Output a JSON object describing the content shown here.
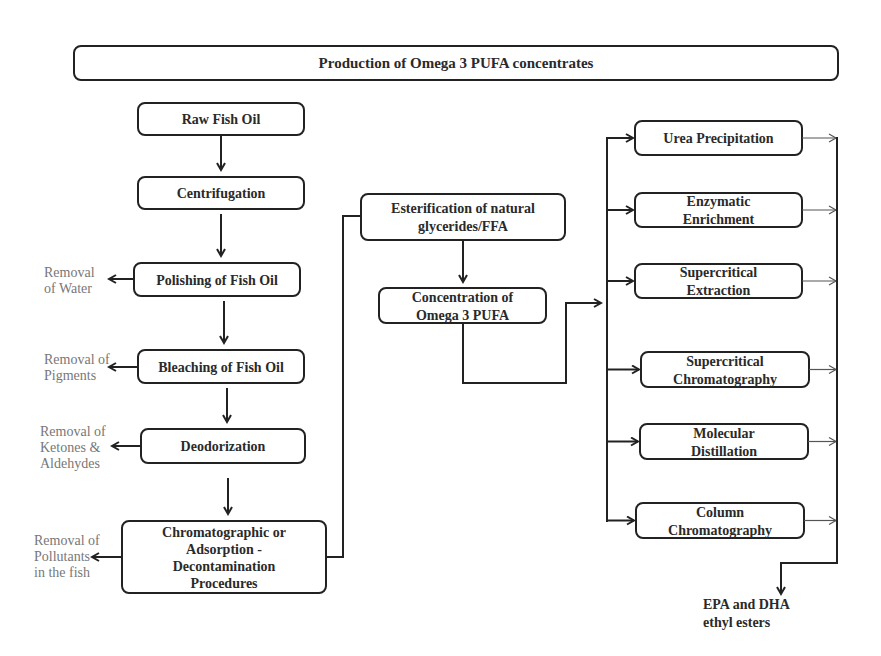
{
  "title": "Production of Omega 3 PUFA concentrates",
  "left_chain": [
    {
      "id": "raw",
      "lines": [
        "Raw Fish Oil"
      ]
    },
    {
      "id": "centrifugation",
      "lines": [
        "Centrifugation"
      ]
    },
    {
      "id": "polishing",
      "lines": [
        "Polishing of Fish Oil"
      ]
    },
    {
      "id": "bleaching",
      "lines": [
        "Bleaching of Fish Oil"
      ]
    },
    {
      "id": "deodorization",
      "lines": [
        "Deodorization"
      ]
    },
    {
      "id": "decontamination",
      "lines": [
        "Chromatographic or",
        "Adsorption -",
        "Decontamination",
        "Procedures"
      ]
    }
  ],
  "side_notes": [
    {
      "for": "polishing",
      "lines": [
        "Removal",
        "of Water"
      ]
    },
    {
      "for": "bleaching",
      "lines": [
        "Removal of",
        "Pigments"
      ]
    },
    {
      "for": "deodorization",
      "lines": [
        "Removal of",
        "Ketones &",
        "Aldehydes"
      ]
    },
    {
      "for": "decontamination",
      "lines": [
        "Removal of",
        "Pollutants",
        "in the fish"
      ]
    }
  ],
  "middle_chain": [
    {
      "id": "esterification",
      "lines": [
        "Esterification of natural",
        "glycerides/FFA"
      ]
    },
    {
      "id": "concentration",
      "lines": [
        "Concentration of",
        "Omega 3 PUFA"
      ]
    }
  ],
  "methods": [
    {
      "id": "urea",
      "lines": [
        "Urea Precipitation"
      ]
    },
    {
      "id": "enzymatic",
      "lines": [
        "Enzymatic",
        "Enrichment"
      ]
    },
    {
      "id": "sfe",
      "lines": [
        "Supercritical",
        "Extraction"
      ]
    },
    {
      "id": "sfc",
      "lines": [
        "Supercritical",
        "Chromatography"
      ]
    },
    {
      "id": "molecular",
      "lines": [
        "Molecular",
        "Distillation"
      ]
    },
    {
      "id": "column",
      "lines": [
        "Column",
        "Chromatography"
      ]
    }
  ],
  "output": {
    "lines": [
      "EPA and DHA",
      "ethyl esters"
    ]
  }
}
